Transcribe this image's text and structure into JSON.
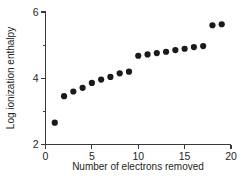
{
  "chart_data": {
    "type": "scatter",
    "title": "",
    "xlabel": "Number of electrons removed",
    "ylabel": "Log ionization enthalpy",
    "xlim": [
      0,
      20
    ],
    "ylim": [
      2,
      6
    ],
    "xticks": [
      0,
      5,
      10,
      15,
      20
    ],
    "xtick_labels": [
      "0",
      "5",
      "10",
      "15",
      "20"
    ],
    "yticks": [
      2,
      3,
      4,
      5,
      6
    ],
    "ytick_labels": [
      "2",
      "",
      "4",
      "",
      "6"
    ],
    "y_minor_ticks": [
      3,
      5
    ],
    "grid": false,
    "legend": null,
    "marker": "circle",
    "marker_color": "#1a1a1a",
    "marker_size": 3.1,
    "series": [
      {
        "name": "Log ionization enthalpy",
        "x": [
          1,
          2,
          3,
          4,
          5,
          6,
          7,
          8,
          9,
          10,
          11,
          12,
          13,
          14,
          15,
          16,
          17,
          18,
          19
        ],
        "values": [
          2.66,
          3.46,
          3.6,
          3.71,
          3.86,
          3.96,
          4.04,
          4.15,
          4.2,
          4.68,
          4.72,
          4.76,
          4.8,
          4.85,
          4.89,
          4.94,
          4.97,
          5.6,
          5.63
        ]
      }
    ],
    "annotations": []
  },
  "axis": {
    "y_title": "Log ionization enthalpy",
    "x_title": "Number of electrons removed"
  },
  "caption": {
    "partial_text": ""
  }
}
